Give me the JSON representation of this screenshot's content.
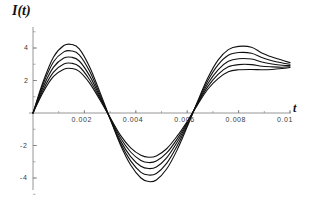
{
  "figure": {
    "axis_label_y": "I(t)",
    "axis_label_x": "t",
    "background_color": "#ffffff",
    "curve_color": "#101010",
    "axis_color": "#7b7b7b"
  },
  "xticks": [
    {
      "label": "0.002",
      "value": 0.002
    },
    {
      "label": "0.004",
      "value": 0.004
    },
    {
      "label": "0.006",
      "value": 0.006
    },
    {
      "label": "0.008",
      "value": 0.008
    },
    {
      "label": "0.01",
      "value": 0.01
    }
  ],
  "yticks": [
    {
      "label": "4",
      "value": 4
    },
    {
      "label": "2",
      "value": 2
    },
    {
      "label": "-2",
      "value": -2
    },
    {
      "label": "-4",
      "value": -4
    }
  ],
  "chart_data": {
    "type": "line",
    "title": "",
    "xlabel": "t",
    "ylabel": "I(t)",
    "xlim": [
      0,
      0.0105
    ],
    "ylim": [
      -5.0,
      5.0
    ],
    "grid": false,
    "legend": "none",
    "x_tick_values": [
      0.002,
      0.004,
      0.006,
      0.008,
      0.01
    ],
    "x_tick_labels": [
      "0.002",
      "0.004",
      "0.006",
      "0.008",
      "0.01"
    ],
    "y_tick_values": [
      4,
      2,
      -2,
      -4
    ],
    "y_tick_labels": [
      "4",
      "2",
      "-2",
      "-4"
    ],
    "series": [
      {
        "name": "curve-1",
        "amplitude": 4.25,
        "x": [
          0,
          0.0004,
          0.0008,
          0.0012,
          0.0015,
          0.0018,
          0.0022,
          0.0026,
          0.003,
          0.0034,
          0.0038,
          0.0042,
          0.0045,
          0.0048,
          0.0052,
          0.0056,
          0.006,
          0.0064,
          0.0068,
          0.0072,
          0.0076,
          0.008,
          0.0085,
          0.0089,
          0.0093,
          0.0097,
          0.01
        ],
        "y": [
          0,
          1.95,
          3.45,
          4.15,
          4.22,
          3.95,
          2.85,
          1.3,
          -0.35,
          -1.95,
          -3.2,
          -4.0,
          -4.22,
          -4.12,
          -3.45,
          -2.3,
          -0.85,
          0.7,
          2.15,
          3.25,
          3.9,
          4.1,
          4.05,
          3.7,
          3.45,
          3.25,
          3.1
        ]
      },
      {
        "name": "curve-2",
        "amplitude": 3.85,
        "x": [
          0,
          0.0004,
          0.0008,
          0.0012,
          0.0015,
          0.0018,
          0.0022,
          0.0026,
          0.003,
          0.0034,
          0.0038,
          0.0042,
          0.0045,
          0.0048,
          0.0052,
          0.0056,
          0.006,
          0.0064,
          0.0068,
          0.0072,
          0.0076,
          0.008,
          0.0085,
          0.0089,
          0.0093,
          0.0097,
          0.01
        ],
        "y": [
          0,
          1.8,
          3.15,
          3.76,
          3.82,
          3.58,
          2.58,
          1.15,
          -0.35,
          -1.85,
          -2.95,
          -3.65,
          -3.82,
          -3.72,
          -3.1,
          -2.05,
          -0.75,
          0.65,
          1.98,
          2.96,
          3.55,
          3.72,
          3.68,
          3.42,
          3.22,
          3.08,
          3.0
        ]
      },
      {
        "name": "curve-3",
        "amplitude": 3.45,
        "x": [
          0,
          0.0004,
          0.0008,
          0.0012,
          0.0015,
          0.0018,
          0.0022,
          0.0026,
          0.003,
          0.0034,
          0.0038,
          0.0042,
          0.0045,
          0.0048,
          0.0052,
          0.0056,
          0.006,
          0.0064,
          0.0068,
          0.0072,
          0.0076,
          0.008,
          0.0085,
          0.0089,
          0.0093,
          0.0097,
          0.01
        ],
        "y": [
          0,
          1.62,
          2.82,
          3.38,
          3.43,
          3.2,
          2.3,
          1.02,
          -0.33,
          -1.7,
          -2.68,
          -3.28,
          -3.42,
          -3.32,
          -2.76,
          -1.82,
          -0.65,
          0.6,
          1.8,
          2.66,
          3.18,
          3.34,
          3.32,
          3.14,
          3.02,
          2.94,
          2.92
        ]
      },
      {
        "name": "curve-4",
        "amplitude": 3.08,
        "x": [
          0,
          0.0004,
          0.0008,
          0.0012,
          0.0015,
          0.0018,
          0.0022,
          0.0026,
          0.003,
          0.0034,
          0.0038,
          0.0042,
          0.0045,
          0.0048,
          0.0052,
          0.0056,
          0.006,
          0.0064,
          0.0068,
          0.0072,
          0.0076,
          0.008,
          0.0085,
          0.0089,
          0.0093,
          0.0097,
          0.01
        ],
        "y": [
          0,
          1.45,
          2.52,
          3.02,
          3.06,
          2.86,
          2.05,
          0.92,
          -0.3,
          -1.52,
          -2.4,
          -2.92,
          -3.05,
          -2.96,
          -2.46,
          -1.62,
          -0.58,
          0.55,
          1.62,
          2.38,
          2.84,
          2.98,
          2.98,
          2.88,
          2.84,
          2.82,
          2.85
        ]
      },
      {
        "name": "curve-5",
        "amplitude": 2.75,
        "x": [
          0,
          0.0004,
          0.0008,
          0.0012,
          0.0015,
          0.0018,
          0.0022,
          0.0026,
          0.003,
          0.0034,
          0.0038,
          0.0042,
          0.0045,
          0.0048,
          0.0052,
          0.0056,
          0.006,
          0.0064,
          0.0068,
          0.0072,
          0.0076,
          0.008,
          0.0085,
          0.0089,
          0.0093,
          0.0097,
          0.01
        ],
        "y": [
          0,
          1.3,
          2.25,
          2.7,
          2.74,
          2.56,
          1.84,
          0.82,
          -0.28,
          -1.36,
          -2.14,
          -2.6,
          -2.72,
          -2.64,
          -2.2,
          -1.44,
          -0.52,
          0.5,
          1.46,
          2.12,
          2.54,
          2.66,
          2.68,
          2.66,
          2.68,
          2.74,
          2.8
        ]
      }
    ]
  }
}
